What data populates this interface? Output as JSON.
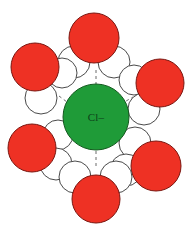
{
  "figure": {
    "background_color": "#ffffff",
    "width": 191,
    "height": 231
  },
  "ion": {
    "label": "Cl–",
    "species": "chloride",
    "charge": "-1",
    "fill_color": "#1f9b38",
    "stroke_color": "#14591f",
    "label_color": "#0d3f18",
    "cx": 96,
    "cy": 117,
    "r": 33
  },
  "bond_style": {
    "type": "hydrogen-bond",
    "stroke_color": "#6b6b6b",
    "dash": "3 3",
    "width": 1
  },
  "atom_colors": {
    "oxygen_fill": "#ee3124",
    "oxygen_stroke": "#7a1610",
    "hydrogen_fill": "#ffffff",
    "hydrogen_stroke": "#4a4a4a"
  },
  "legend_notes": {
    "oxygen": "oxygen",
    "hydrogen": "hydrogen",
    "chloride": "chloride ion"
  },
  "water_molecules": [
    {
      "name": "water-top",
      "position": "top",
      "oxygen": {
        "cx": 94,
        "cy": 38,
        "r": 25
      },
      "hydrogens": [
        {
          "cx": 74,
          "cy": 62,
          "r": 16
        },
        {
          "cx": 114,
          "cy": 62,
          "r": 16
        }
      ],
      "bond": {
        "x1": 96,
        "y1": 70,
        "x2": 96,
        "y2": 84
      }
    },
    {
      "name": "water-upper-left",
      "position": "upper-left",
      "oxygen": {
        "cx": 35,
        "cy": 67,
        "r": 24
      },
      "hydrogens": [
        {
          "cx": 41,
          "cy": 98,
          "r": 16
        },
        {
          "cx": 62,
          "cy": 73,
          "r": 15
        }
      ],
      "bond": {
        "x1": 59,
        "y1": 96,
        "x2": 71,
        "y2": 105
      }
    },
    {
      "name": "water-upper-right",
      "position": "upper-right",
      "oxygen": {
        "cx": 160,
        "cy": 83,
        "r": 24
      },
      "hydrogens": [
        {
          "cx": 134,
          "cy": 80,
          "r": 15
        },
        {
          "cx": 144,
          "cy": 109,
          "r": 16
        }
      ],
      "bond": {
        "x1": 121,
        "y1": 104,
        "x2": 133,
        "y2": 97
      }
    },
    {
      "name": "water-lower-left",
      "position": "lower-left",
      "oxygen": {
        "cx": 32,
        "cy": 148,
        "r": 24
      },
      "hydrogens": [
        {
          "cx": 58,
          "cy": 135,
          "r": 15
        },
        {
          "cx": 56,
          "cy": 164,
          "r": 16
        }
      ],
      "bond": {
        "x1": 63,
        "y1": 131,
        "x2": 72,
        "y2": 127
      }
    },
    {
      "name": "water-lower-right",
      "position": "lower-right",
      "oxygen": {
        "cx": 156,
        "cy": 166,
        "r": 25
      },
      "hydrogens": [
        {
          "cx": 135,
          "cy": 143,
          "r": 16
        },
        {
          "cx": 126,
          "cy": 170,
          "r": 16
        }
      ],
      "bond": {
        "x1": 120,
        "y1": 133,
        "x2": 131,
        "y2": 142
      }
    },
    {
      "name": "water-bottom",
      "position": "bottom",
      "oxygen": {
        "cx": 96,
        "cy": 199,
        "r": 24
      },
      "hydrogens": [
        {
          "cx": 75,
          "cy": 177,
          "r": 16
        },
        {
          "cx": 116,
          "cy": 177,
          "r": 16
        }
      ],
      "bond": {
        "x1": 96,
        "y1": 151,
        "x2": 96,
        "y2": 166
      }
    }
  ]
}
